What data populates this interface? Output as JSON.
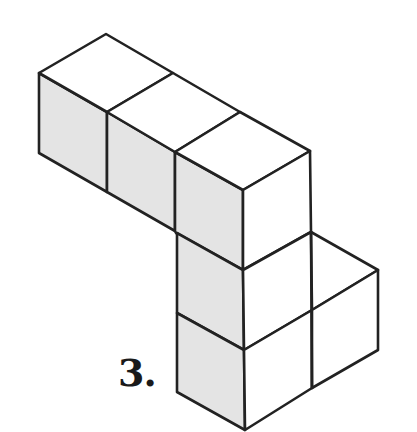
{
  "figure": {
    "label": "3.",
    "cube_count": 6,
    "colors": {
      "stroke": "#222222",
      "top_face": "#ffffff",
      "left_face": "#e4e4e4",
      "right_face": "#ffffff",
      "background": "#ffffff"
    }
  }
}
